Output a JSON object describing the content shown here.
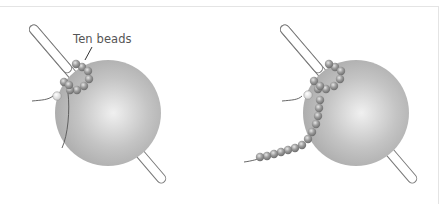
{
  "figure": {
    "panels": [
      {
        "id": "left",
        "description": "Ball on dowel with a ring of ten beads strung around the dowel; thread tail exits",
        "label": "Ten beads",
        "bead_count_ring": 10
      },
      {
        "id": "right",
        "description": "Same ball and dowel; ring of beads with a long strand of additional beads trailing down-left",
        "bead_count_strand": 13
      }
    ],
    "colors": {
      "ball": "#b5b5b5",
      "ball_highlight": "#ececec",
      "bead": "#8c8c8c",
      "bead_highlight": "#d8d8d8",
      "dowel_stroke": "#7a7a7a",
      "thread": "#555555",
      "label_text": "#555555"
    }
  }
}
